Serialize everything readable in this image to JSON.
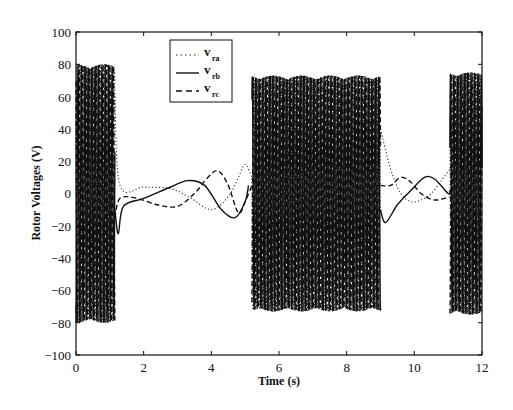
{
  "chart_data": {
    "type": "line",
    "title": "",
    "xlabel": "Time (s)",
    "ylabel": "Rotor Voltages (V)",
    "xlim": [
      0,
      12
    ],
    "ylim": [
      -100,
      100
    ],
    "xticks": [
      0,
      2,
      4,
      6,
      8,
      10,
      12
    ],
    "yticks": [
      100,
      80,
      60,
      40,
      20,
      0,
      -20,
      -40,
      -60,
      -80,
      -100
    ],
    "grid": false,
    "legend_position": "upper-left-center",
    "series": [
      {
        "name": "v_ra",
        "label_main": "v",
        "label_sub": "ra",
        "style": "dotted",
        "phase_deg": 0
      },
      {
        "name": "v_rb",
        "label_main": "v",
        "label_sub": "rb",
        "style": "solid",
        "phase_deg": -120
      },
      {
        "name": "v_rc",
        "label_main": "v",
        "label_sub": "rc",
        "style": "dashed",
        "phase_deg": 120
      }
    ],
    "segments": [
      {
        "kind": "oscillation",
        "t_start": 0.0,
        "t_end": 1.15,
        "amplitude": 80,
        "cycles_per_s": 4.5
      },
      {
        "kind": "transient",
        "t_start": 1.15,
        "t_end": 5.2,
        "points": {
          "v_ra": [
            [
              1.15,
              60
            ],
            [
              1.3,
              5
            ],
            [
              2.0,
              4
            ],
            [
              2.8,
              3
            ],
            [
              3.4,
              -3
            ],
            [
              4.0,
              -10
            ],
            [
              4.5,
              -2
            ],
            [
              4.8,
              10
            ],
            [
              5.0,
              18
            ],
            [
              5.2,
              10
            ]
          ],
          "v_rb": [
            [
              1.15,
              -10
            ],
            [
              1.25,
              -25
            ],
            [
              1.4,
              -8
            ],
            [
              2.0,
              -3
            ],
            [
              2.8,
              4
            ],
            [
              3.3,
              8
            ],
            [
              3.8,
              5
            ],
            [
              4.3,
              -10
            ],
            [
              4.7,
              -15
            ],
            [
              5.0,
              -5
            ],
            [
              5.1,
              5
            ]
          ],
          "v_rc": [
            [
              1.15,
              -15
            ],
            [
              1.3,
              -3
            ],
            [
              1.8,
              -3
            ],
            [
              2.4,
              -7
            ],
            [
              3.0,
              -8
            ],
            [
              3.5,
              0
            ],
            [
              3.9,
              10
            ],
            [
              4.2,
              14
            ],
            [
              4.5,
              5
            ],
            [
              4.8,
              -12
            ],
            [
              5.0,
              -5
            ],
            [
              5.2,
              5
            ]
          ]
        }
      },
      {
        "kind": "oscillation",
        "t_start": 5.2,
        "t_end": 9.0,
        "amplitude": 73,
        "cycles_per_s": 4.5
      },
      {
        "kind": "transient",
        "t_start": 9.0,
        "t_end": 11.05,
        "points": {
          "v_ra": [
            [
              9.0,
              40
            ],
            [
              9.3,
              15
            ],
            [
              9.6,
              0
            ],
            [
              9.9,
              -5
            ],
            [
              10.2,
              -4
            ],
            [
              10.5,
              0
            ],
            [
              10.8,
              8
            ],
            [
              11.05,
              15
            ]
          ],
          "v_rb": [
            [
              9.0,
              -10
            ],
            [
              9.15,
              -18
            ],
            [
              9.5,
              -7
            ],
            [
              9.9,
              2
            ],
            [
              10.3,
              10
            ],
            [
              10.6,
              9
            ],
            [
              11.0,
              0
            ],
            [
              11.05,
              2
            ]
          ],
          "v_rc": [
            [
              9.0,
              5
            ],
            [
              9.3,
              5
            ],
            [
              9.6,
              10
            ],
            [
              9.9,
              7
            ],
            [
              10.2,
              0
            ],
            [
              10.6,
              -4
            ],
            [
              11.05,
              -2
            ]
          ]
        }
      },
      {
        "kind": "oscillation",
        "t_start": 11.05,
        "t_end": 12.0,
        "amplitude": 75,
        "cycles_per_s": 4.5
      }
    ]
  },
  "axes": {
    "xlabel": "Time (s)",
    "ylabel": "Rotor Voltages (V)",
    "xtick_labels": [
      "0",
      "2",
      "4",
      "6",
      "8",
      "10",
      "12"
    ],
    "ytick_labels": [
      "100",
      "80",
      "60",
      "40",
      "20",
      "0",
      "−20",
      "−40",
      "−60",
      "−80",
      "−100"
    ]
  },
  "legend": {
    "items": [
      {
        "main": "v",
        "sub": "ra"
      },
      {
        "main": "v",
        "sub": "rb"
      },
      {
        "main": "v",
        "sub": "rc"
      }
    ]
  }
}
